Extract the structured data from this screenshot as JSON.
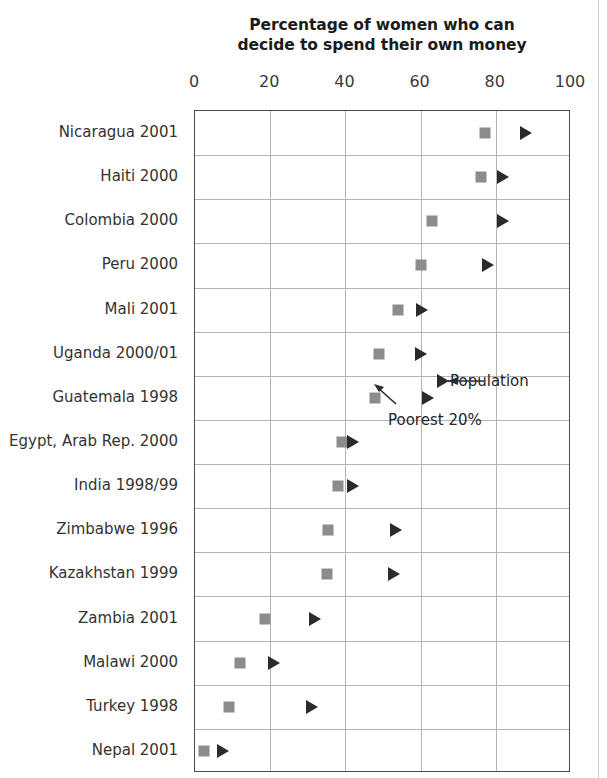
{
  "chart_data": {
    "type": "scatter",
    "title": "Percentage of women who can decide to spend their own money",
    "title_lines": [
      "Percentage of women who can",
      "decide to spend their own money"
    ],
    "xlabel": "",
    "ylabel": "",
    "xlim": [
      0,
      100
    ],
    "xticks": [
      0,
      20,
      40,
      60,
      80,
      100
    ],
    "xtick_labels": [
      "0",
      "20",
      "40",
      "60",
      "80",
      "100"
    ],
    "grid": "vertical-and-horizontal",
    "legend_position": "inline-annotation",
    "series": [
      {
        "name": "Poorest 20%",
        "marker": "square",
        "color": "#8c8c8c",
        "values": [
          77,
          76,
          63,
          60,
          54,
          49,
          48,
          39,
          38,
          35.5,
          35,
          18.5,
          12,
          9,
          2.5
        ]
      },
      {
        "name": "Population",
        "marker": "triangle",
        "color": "#2b2b2b",
        "values": [
          88,
          82,
          82,
          78,
          60.5,
          60,
          62,
          42,
          42,
          53.5,
          53,
          32,
          21,
          31,
          7.5
        ]
      }
    ],
    "categories": [
      "Nicaragua 2001",
      "Haiti 2000",
      "Colombia 2000",
      "Peru 2000",
      "Mali 2001",
      "Uganda 2000/01",
      "Guatemala 1998",
      "Egypt, Arab Rep. 2000",
      "India 1998/99",
      "Zimbabwe 1996",
      "Kazakhstan 1999",
      "Zambia 2001",
      "Malawi 2000",
      "Turkey 1998",
      "Nepal 2001"
    ],
    "annotations": [
      {
        "text": "Population",
        "points_to": "triangle-marker",
        "arrow": "left"
      },
      {
        "text": "Poorest 20%",
        "points_to": "square-marker",
        "arrow": "up-left"
      }
    ]
  },
  "colors": {
    "square_marker": "#8c8c8c",
    "triangle_marker": "#2b2b2b",
    "gridline": "#b4b4b4",
    "axis_frame": "#4a4a4a",
    "text": "#333333"
  }
}
